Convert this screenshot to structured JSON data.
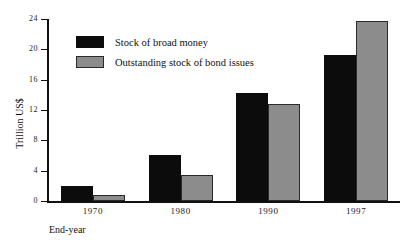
{
  "chart_data": {
    "type": "bar",
    "title": "",
    "subtitle": "",
    "xlabel": "End-year",
    "ylabel": "Trillion US$",
    "categories": [
      "1970",
      "1980",
      "1990",
      "1997"
    ],
    "series": [
      {
        "name": "Stock of broad money",
        "color": "#0c0c0c",
        "values": [
          2.0,
          6.1,
          14.2,
          19.3
        ]
      },
      {
        "name": "Outstanding stock of bond issues",
        "color": "#8c8c8c",
        "values": [
          0.8,
          3.4,
          12.8,
          23.8
        ]
      }
    ],
    "ylim": [
      0,
      24
    ],
    "yticks": [
      0,
      4,
      8,
      12,
      16,
      20,
      24
    ],
    "ytick_labels": [
      "0",
      "4",
      "8",
      "12",
      "16",
      "20",
      "24"
    ],
    "grid": false,
    "legend_position": "top-left",
    "axis_color": "#111111",
    "background": "#ffffff"
  }
}
